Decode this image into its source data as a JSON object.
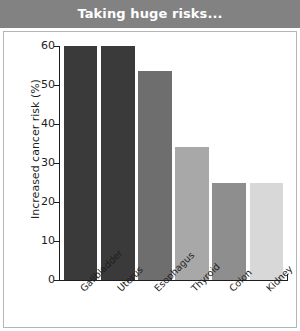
{
  "header": {
    "title": "Taking huge risks..."
  },
  "chart_data": {
    "type": "bar",
    "title": "Taking huge risks...",
    "xlabel": "",
    "ylabel": "Increased cancer risk (%)",
    "categories": [
      "Gallbladder",
      "Uterus",
      "Esophagus",
      "Thyroid",
      "Colon",
      "Kidney"
    ],
    "values": [
      60,
      60,
      53.5,
      34,
      25,
      25
    ],
    "bar_colors": [
      "#3a3a3a",
      "#3a3a3a",
      "#6e6e6e",
      "#a8a8a8",
      "#8e8e8e",
      "#d8d8d8"
    ],
    "ylim": [
      0,
      60
    ],
    "yticks": [
      0,
      10,
      20,
      30,
      40,
      50,
      60
    ],
    "ytick_labels": [
      "0",
      "10",
      "20",
      "30",
      "40",
      "50",
      "60"
    ],
    "grid": false,
    "legend": "none"
  },
  "style": {
    "header_background": "#828282",
    "header_text_color": "#ffffff",
    "panel_background": "#ffffff",
    "panel_border": "#b5b5b5",
    "axis_color": "#1d1d1d"
  }
}
